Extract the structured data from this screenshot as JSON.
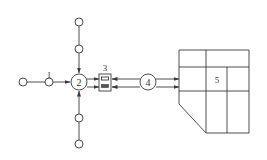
{
  "diagram": {
    "type": "process-flow",
    "labels": {
      "n1": "1",
      "n2": "2",
      "n3": "3",
      "n4": "4",
      "n5": "5"
    },
    "nodes": [
      {
        "id": "source-left",
        "label": "",
        "shape": "small-circle"
      },
      {
        "id": "n1",
        "label": "1",
        "shape": "small-circle"
      },
      {
        "id": "n2",
        "label": "2",
        "shape": "large-circle"
      },
      {
        "id": "n3",
        "label": "3",
        "shape": "box-with-two-slots"
      },
      {
        "id": "n4",
        "label": "4",
        "shape": "large-circle"
      },
      {
        "id": "n5",
        "label": "5",
        "shape": "grid-block-with-chamfer"
      },
      {
        "id": "top-outer",
        "label": "",
        "shape": "small-circle"
      },
      {
        "id": "top-inner",
        "label": "",
        "shape": "small-circle"
      },
      {
        "id": "bottom-inner",
        "label": "",
        "shape": "small-circle"
      },
      {
        "id": "bottom-outer",
        "label": "",
        "shape": "small-circle"
      }
    ],
    "edges": [
      {
        "from": "source-left",
        "to": "n1",
        "arrow": false
      },
      {
        "from": "n1",
        "to": "n2",
        "arrow": true
      },
      {
        "from": "top-outer",
        "to": "top-inner",
        "arrow": false
      },
      {
        "from": "top-inner",
        "to": "n2",
        "arrow": true
      },
      {
        "from": "bottom-outer",
        "to": "bottom-inner",
        "arrow": false
      },
      {
        "from": "bottom-inner",
        "to": "n2",
        "arrow": true
      },
      {
        "from": "n2",
        "to": "n3",
        "arrow": true,
        "lines": 2
      },
      {
        "from": "n3",
        "to": "n4",
        "arrow": true,
        "lines": 2
      },
      {
        "from": "n4",
        "to": "n5",
        "arrow": true,
        "lines": 2
      }
    ],
    "colors": {
      "stroke": "#3a3a3a",
      "background": "#ffffff",
      "text": "#333333"
    }
  }
}
